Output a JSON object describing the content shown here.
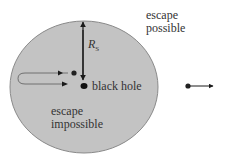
{
  "diagram": {
    "labels": {
      "escape_possible_line1": "escape",
      "escape_possible_line2": "possible",
      "radius_symbol": "R",
      "radius_subscript": "S",
      "black_hole": "black  hole",
      "escape_impossible_line1": "escape",
      "escape_impossible_line2": "impossible"
    },
    "colors": {
      "horizon_fill": "#c3c3c3",
      "horizon_stroke": "#8a8a8a",
      "ink": "#1a1a1a"
    }
  }
}
